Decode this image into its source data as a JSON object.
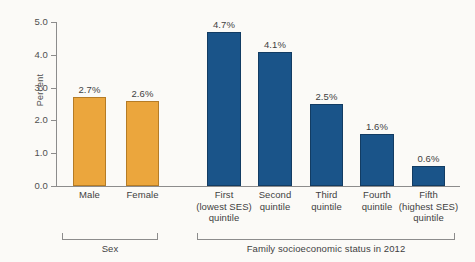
{
  "chart_data": {
    "type": "bar",
    "title": "",
    "xlabel": "",
    "ylabel": "Percent",
    "ylim": [
      0.0,
      5.0
    ],
    "ytick_labels": [
      "5.0",
      "4.0",
      "3.0",
      "2.0",
      "1.0",
      "0.0"
    ],
    "ytick_values": [
      5.0,
      4.0,
      3.0,
      2.0,
      1.0,
      0.0
    ],
    "grid": false,
    "legend": "none",
    "categories": [
      "Male",
      "Female",
      "First (lowest SES) quintile",
      "Second quintile",
      "Third quintile",
      "Fourth quintile",
      "Fifth (highest SES) quintile"
    ],
    "values": [
      2.7,
      2.6,
      4.7,
      4.1,
      2.5,
      1.6,
      0.6
    ],
    "value_labels": [
      "2.7%",
      "2.6%",
      "4.7%",
      "4.1%",
      "2.5%",
      "1.6%",
      "0.6%"
    ],
    "bars": [
      {
        "label_lines": [
          "Male"
        ],
        "value": 2.7,
        "value_label": "2.7%",
        "color": "#eba63d",
        "group": "sex"
      },
      {
        "label_lines": [
          "Female"
        ],
        "value": 2.6,
        "value_label": "2.6%",
        "color": "#eba63d",
        "group": "sex"
      },
      {
        "label_lines": [
          "First",
          "(lowest SES)",
          "quintile"
        ],
        "value": 4.7,
        "value_label": "4.7%",
        "color": "#1a5489",
        "group": "ses"
      },
      {
        "label_lines": [
          "Second",
          "quintile"
        ],
        "value": 4.1,
        "value_label": "4.1%",
        "color": "#1a5489",
        "group": "ses"
      },
      {
        "label_lines": [
          "Third",
          "quintile"
        ],
        "value": 2.5,
        "value_label": "2.5%",
        "color": "#1a5489",
        "group": "ses"
      },
      {
        "label_lines": [
          "Fourth",
          "quintile"
        ],
        "value": 1.6,
        "value_label": "1.6%",
        "color": "#1a5489",
        "group": "ses"
      },
      {
        "label_lines": [
          "Fifth",
          "(highest SES)",
          "quintile"
        ],
        "value": 0.6,
        "value_label": "0.6%",
        "color": "#1a5489",
        "group": "ses"
      }
    ],
    "groups": [
      {
        "id": "sex",
        "label": "Sex",
        "color": "#eba63d"
      },
      {
        "id": "ses",
        "label": "Family socioeconomic status in 2012",
        "color": "#1a5489"
      }
    ],
    "colors": {
      "sex_bar": "#eba63d",
      "ses_bar": "#1a5489",
      "axis": "#8c8c8c",
      "text": "#3f3f3f",
      "background": "#fbfaf7"
    }
  },
  "axis": {
    "y_title": "Percent",
    "ticks": [
      "5.0",
      "4.0",
      "3.0",
      "2.0",
      "1.0",
      "0.0"
    ]
  },
  "groups": {
    "sex_label": "Sex",
    "ses_label": "Family socioeconomic status in 2012"
  }
}
